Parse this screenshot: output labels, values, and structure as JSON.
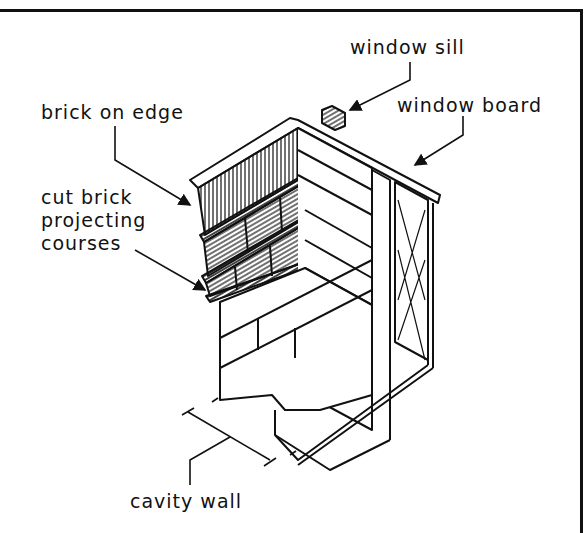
{
  "diagram": {
    "type": "isometric construction detail",
    "labels": {
      "window_sill": "window sill",
      "window_board": "window board",
      "brick_on_edge": "brick on edge",
      "cut_brick_line1": "cut brick",
      "cut_brick_line2": "projecting",
      "cut_brick_line3": "courses",
      "cavity_wall": "cavity wall"
    },
    "colors": {
      "line": "#111111",
      "background": "#ffffff"
    }
  }
}
